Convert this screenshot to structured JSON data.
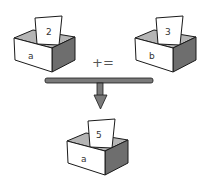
{
  "diagram": {
    "operator": "+=",
    "colors": {
      "box_front": "#ffffff",
      "box_side": "#6e6e6e",
      "box_inner": "#b5b5b5",
      "outline": "#1a1a1a",
      "arrow": "#7a7a7a"
    },
    "boxes": [
      {
        "name": "a",
        "value": "2",
        "role": "left-operand"
      },
      {
        "name": "b",
        "value": "3",
        "role": "right-operand"
      },
      {
        "name": "a",
        "value": "5",
        "role": "result"
      }
    ]
  }
}
